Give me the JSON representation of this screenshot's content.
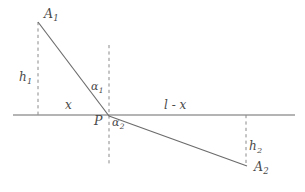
{
  "figure": {
    "background_color": "#ffffff",
    "stroke_color": "#6b6b6b",
    "dash_color": "#8a8a8a",
    "label_color": "#4a4a4a"
  },
  "labels": {
    "point_a1": "A",
    "point_a1_sub": "1",
    "point_a2": "A",
    "point_a2_sub": "2",
    "point_p": "P",
    "height_1": "h",
    "height_1_sub": "1",
    "height_2": "h",
    "height_2_sub": "2",
    "angle_1": "α",
    "angle_1_sub": "1",
    "angle_2": "α",
    "angle_2_sub": "2",
    "segment_x": "x",
    "segment_l_minus_x": "l - x"
  },
  "geometry": {
    "interface_line": {
      "x1": 13,
      "y1": 115,
      "x2": 295,
      "y2": 115
    },
    "ray_incident": {
      "x1": 38,
      "y1": 22,
      "x2": 109,
      "y2": 116
    },
    "ray_refracted": {
      "x1": 109,
      "y1": 116,
      "x2": 247,
      "y2": 166
    },
    "dashed_vertical_left": {
      "x": 38,
      "y1": 22,
      "y2": 117
    },
    "dashed_vertical_middle": {
      "x": 109,
      "y1": 45,
      "y2": 166
    },
    "dashed_vertical_right": {
      "x": 246,
      "y1": 115,
      "y2": 166
    },
    "point_a1_xy": [
      38,
      22
    ],
    "point_p_xy": [
      109,
      116
    ],
    "point_a2_xy": [
      247,
      166
    ]
  },
  "label_positions": {
    "a1": {
      "left": 44,
      "top": 8
    },
    "h1": {
      "left": 19,
      "top": 71
    },
    "x": {
      "left": 65,
      "top": 99
    },
    "alpha1": {
      "left": 91,
      "top": 81
    },
    "p": {
      "left": 94,
      "top": 115
    },
    "alpha2": {
      "left": 112,
      "top": 117
    },
    "l_minus_x": {
      "left": 164,
      "top": 99
    },
    "h2": {
      "left": 249,
      "top": 140
    },
    "a2": {
      "left": 254,
      "top": 161
    }
  }
}
